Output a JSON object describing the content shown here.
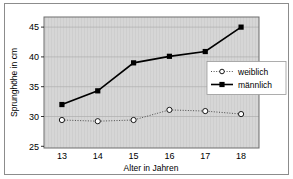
{
  "chart_data": {
    "type": "line",
    "title": "",
    "xlabel": "Alter in Jahren",
    "ylabel": "Sprunghöhe in cm",
    "categories": [
      "13",
      "14",
      "15",
      "16",
      "17",
      "18"
    ],
    "x": [
      13,
      14,
      15,
      16,
      17,
      18
    ],
    "xlim": [
      12.5,
      18.5
    ],
    "ylim": [
      25,
      47
    ],
    "yticks": [
      "25",
      "30",
      "35",
      "40",
      "45"
    ],
    "ytick_values": [
      25,
      30,
      35,
      40,
      45
    ],
    "grid": true,
    "legend_position": "center-right",
    "plot_background": "#d6d6d6",
    "series": [
      {
        "name": "weiblich",
        "values": [
          29.7,
          29.5,
          29.7,
          31.4,
          31.2,
          30.7
        ],
        "color": "#000000",
        "line_style": "dotted",
        "marker": "open-circle"
      },
      {
        "name": "männlich",
        "values": [
          32.3,
          34.6,
          39.3,
          40.4,
          41.2,
          45.3
        ],
        "color": "#000000",
        "line_style": "solid",
        "marker": "filled-square"
      }
    ]
  },
  "axes": {
    "ytick_0": "25",
    "ytick_1": "30",
    "ytick_2": "35",
    "ytick_3": "40",
    "ytick_4": "45",
    "xtick_0": "13",
    "xtick_1": "14",
    "xtick_2": "15",
    "xtick_3": "16",
    "xtick_4": "17",
    "xtick_5": "18",
    "x_title": "Alter in Jahren",
    "y_title": "Sprunghöhe in cm"
  },
  "legend": {
    "item_0_label": "weiblich",
    "item_1_label": "männlich"
  }
}
